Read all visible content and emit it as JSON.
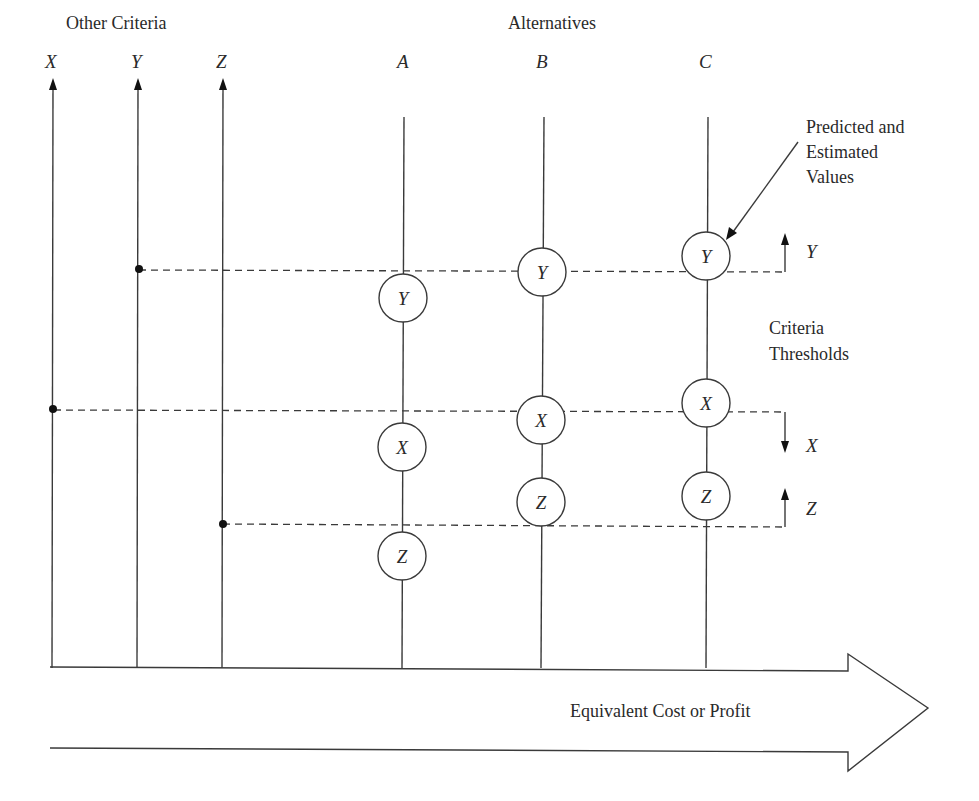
{
  "headings": {
    "other_criteria": "Other Criteria",
    "alternatives": "Alternatives"
  },
  "criteria_axes": [
    {
      "label": "X",
      "x": 52
    },
    {
      "label": "Y",
      "x": 137
    },
    {
      "label": "Z",
      "x": 222
    }
  ],
  "alternatives": [
    {
      "label": "A",
      "x": 404,
      "nodes": [
        {
          "label": "Y",
          "y": 298
        },
        {
          "label": "X",
          "y": 447
        },
        {
          "label": "Z",
          "y": 556
        }
      ]
    },
    {
      "label": "B",
      "x": 542,
      "nodes": [
        {
          "label": "Y",
          "y": 272
        },
        {
          "label": "X",
          "y": 420
        },
        {
          "label": "Z",
          "y": 502
        }
      ]
    },
    {
      "label": "C",
      "x": 706,
      "nodes": [
        {
          "label": "Y",
          "y": 256
        },
        {
          "label": "X",
          "y": 403
        },
        {
          "label": "Z",
          "y": 496
        }
      ]
    }
  ],
  "thresholds": [
    {
      "criterion": "Y",
      "y": 270,
      "direction": "up",
      "label": "Y"
    },
    {
      "criterion": "X",
      "y": 410,
      "direction": "down",
      "label": "X"
    },
    {
      "criterion": "Z",
      "y": 524,
      "direction": "up",
      "label": "Z"
    }
  ],
  "annotations": {
    "predicted_line1": "Predicted and",
    "predicted_line2": "Estimated",
    "predicted_line3": "Values",
    "criteria_line1": "Criteria",
    "criteria_line2": "Thresholds"
  },
  "bottom_arrow": {
    "label": "Equivalent Cost or Profit"
  },
  "colors": {
    "stroke": "#3a3a3a",
    "text": "#2a2a2a",
    "background": "#ffffff"
  }
}
